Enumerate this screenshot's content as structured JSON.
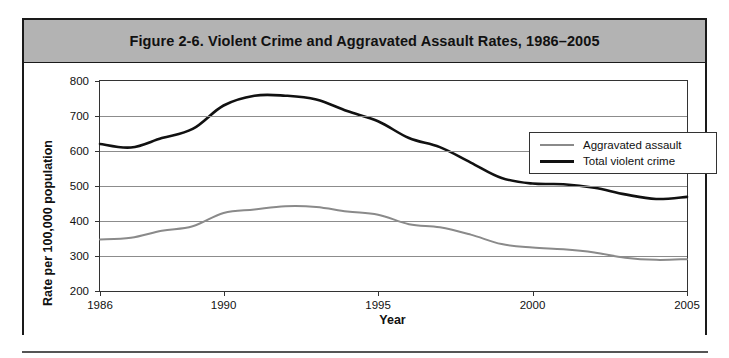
{
  "figure": {
    "title": "Figure 2-6. Violent Crime and Aggravated Assault Rates, 1986–2005",
    "border_color": "#1a1a1a",
    "title_band_color": "#b3b3b3"
  },
  "axes": {
    "ylabel": "Rate per 100,000 population",
    "xlabel": "Year",
    "y_ticks": [
      "800",
      "700",
      "600",
      "500",
      "400",
      "300",
      "200"
    ],
    "x_ticks": [
      "1986",
      "1990",
      "1995",
      "2000",
      "2005"
    ]
  },
  "legend": {
    "position": "top-right",
    "entries": [
      {
        "label": "Aggravated assault",
        "color": "#8a8a8a"
      },
      {
        "label": "Total violent crime",
        "color": "#111111"
      }
    ]
  },
  "chart_data": {
    "type": "line",
    "title": "Figure 2-6. Violent Crime and Aggravated Assault Rates, 1986–2005",
    "xlabel": "Year",
    "ylabel": "Rate per 100,000 population",
    "xlim": [
      1986,
      2005
    ],
    "ylim": [
      200,
      800
    ],
    "ytick_values": [
      200,
      300,
      400,
      500,
      600,
      700,
      800
    ],
    "xtick_values": [
      1986,
      1990,
      1995,
      2000,
      2005
    ],
    "grid": "horizontal",
    "legend_position": "top-right",
    "x": [
      1986,
      1987,
      1988,
      1989,
      1990,
      1991,
      1992,
      1993,
      1994,
      1995,
      1996,
      1997,
      1998,
      1999,
      2000,
      2001,
      2002,
      2003,
      2004,
      2005
    ],
    "series": [
      {
        "name": "Total violent crime",
        "color": "#111111",
        "width": 2.6,
        "values": [
          620,
          610,
          637,
          663,
          730,
          758,
          758,
          747,
          714,
          685,
          637,
          611,
          567,
          523,
          507,
          505,
          495,
          476,
          463,
          469
        ]
      },
      {
        "name": "Aggravated assault",
        "color": "#8a8a8a",
        "width": 2.0,
        "values": [
          347,
          352,
          372,
          385,
          423,
          433,
          442,
          440,
          427,
          418,
          391,
          382,
          361,
          334,
          324,
          319,
          310,
          295,
          289,
          291
        ]
      }
    ]
  }
}
